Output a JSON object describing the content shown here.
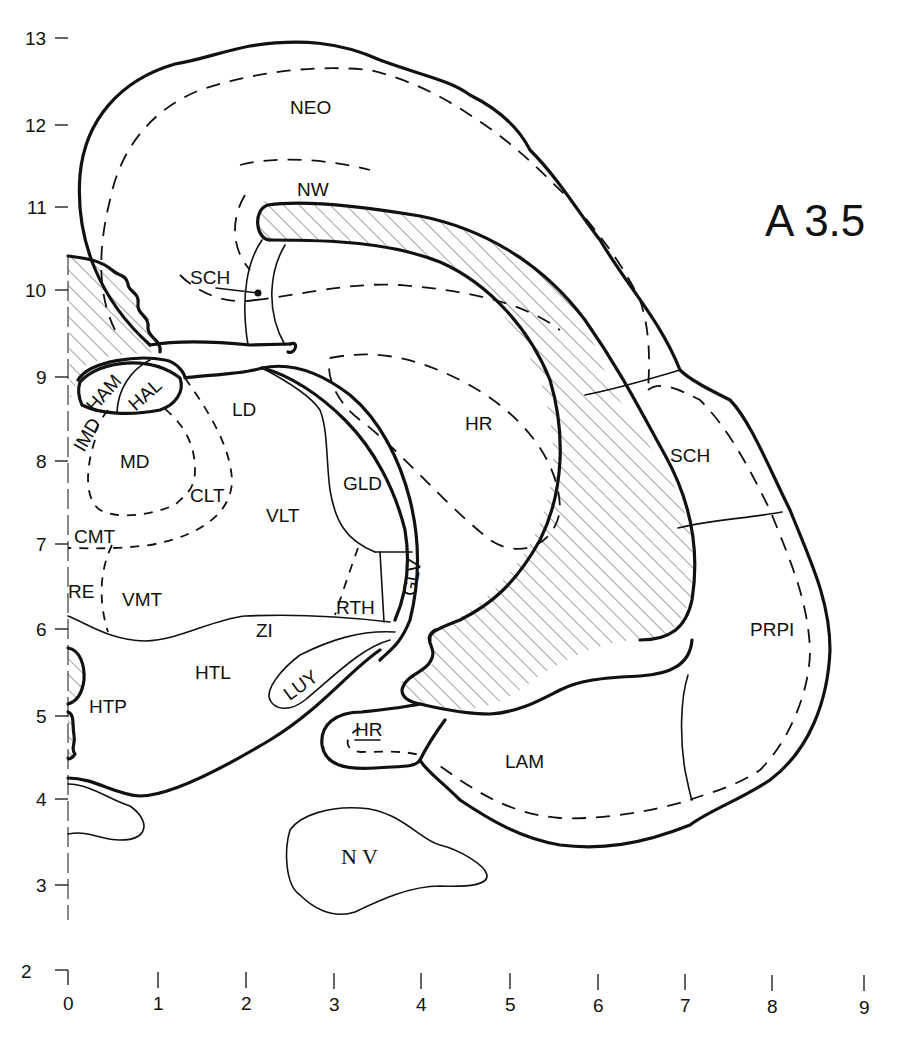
{
  "title": "A 3.5",
  "axes": {
    "y_ticks": [
      "13",
      "12",
      "11",
      "10",
      "9",
      "8",
      "7",
      "6",
      "5",
      "4",
      "3",
      "2"
    ],
    "x_ticks": [
      "0",
      "1",
      "2",
      "3",
      "4",
      "5",
      "6",
      "7",
      "8",
      "9"
    ]
  },
  "regions": {
    "neo": "NEO",
    "nw": "NW",
    "sch_upper": "SCH",
    "ham": "HAM",
    "hal": "HAL",
    "imd": "IMD",
    "md": "MD",
    "ld": "LD",
    "hr_main": "HR",
    "clt": "CLT",
    "gld": "GLD",
    "vlt": "VLT",
    "cmt": "CMT",
    "sch_right": "SCH",
    "re": "RE",
    "vmt": "VMT",
    "rth": "RTH",
    "glv": "GLV",
    "zi": "ZI",
    "prpi": "PRPI",
    "htl": "HTL",
    "luy": "LUY",
    "htp": "HTP",
    "hr_lower": "HR",
    "lam": "LAM",
    "nv": "N V"
  }
}
